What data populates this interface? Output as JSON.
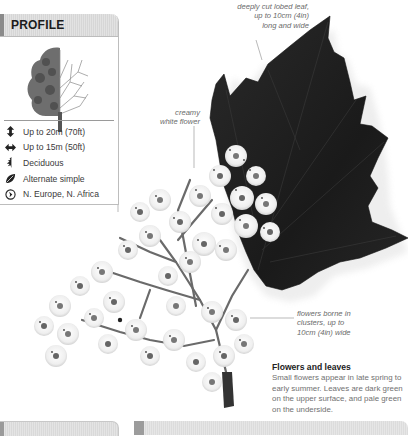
{
  "profile": {
    "title": "PROFILE",
    "illustration": "tree-half-leafed-half-bare",
    "facts": [
      {
        "icon": "height-arrow-icon",
        "label": "Up to 20m (70ft)"
      },
      {
        "icon": "spread-arrow-icon",
        "label": "Up to 15m (50ft)"
      },
      {
        "icon": "deciduous-leaf-icon",
        "label": "Deciduous"
      },
      {
        "icon": "leaf-icon",
        "label": "Alternate simple"
      },
      {
        "icon": "globe-location-icon",
        "label": "N. Europe, N. Africa"
      }
    ]
  },
  "illustration": {
    "subject": "lobed leaf with flower cluster",
    "callouts": {
      "leaf": [
        "deeply cut lobed leaf,",
        "up to 10cm (4in)",
        "long and wide"
      ],
      "flower": [
        "creamy",
        "white flower"
      ],
      "cluster": [
        "flowers borne in",
        "clusters, up to",
        "10cm (4in) wide"
      ]
    }
  },
  "caption": {
    "title": "Flowers and leaves",
    "body": "Small flowers appear in late spring to early summer. Leaves are dark green on the upper surface, and pale green on the underside."
  },
  "colors": {
    "header_bg": "#dcdcdc",
    "header_accent": "#8a8a8a",
    "leaf": "#1e1e1e",
    "text_muted": "#707070"
  }
}
